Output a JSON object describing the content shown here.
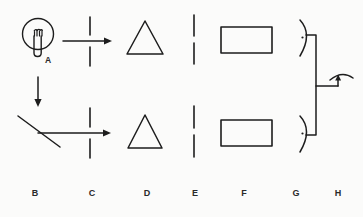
{
  "figure": {
    "kind": "hand-drawn-optics-diagram",
    "background_color": "#fbfbfa",
    "ink_color": "#1d1d1d",
    "width": 363,
    "height": 217
  },
  "inline_labels": [
    {
      "id": "label-a",
      "text": "A",
      "x": 41,
      "y": 55
    }
  ],
  "column_labels": [
    {
      "id": "label-b",
      "text": "B",
      "x": 27,
      "y": 188
    },
    {
      "id": "label-c",
      "text": "C",
      "x": 84,
      "y": 188
    },
    {
      "id": "label-d",
      "text": "D",
      "x": 139,
      "y": 188
    },
    {
      "id": "label-e",
      "text": "E",
      "x": 187,
      "y": 188
    },
    {
      "id": "label-f",
      "text": "F",
      "x": 236,
      "y": 188
    },
    {
      "id": "label-g",
      "text": "G",
      "x": 288,
      "y": 188
    },
    {
      "id": "label-h",
      "text": "H",
      "x": 330,
      "y": 188
    }
  ],
  "components": [
    {
      "id": "light-bulb-a",
      "name": "light-bulb",
      "label": "A",
      "row": "top",
      "column": "A"
    },
    {
      "id": "mirror-b",
      "name": "mirror-with-beams",
      "label": "B",
      "row": "bottom",
      "column": "B"
    },
    {
      "id": "slit-c-top",
      "name": "slit-aperture",
      "label": "C",
      "row": "top",
      "column": "C"
    },
    {
      "id": "slit-c-bottom",
      "name": "slit-aperture",
      "label": "C",
      "row": "bottom",
      "column": "C"
    },
    {
      "id": "prism-d-top",
      "name": "prism-triangle",
      "label": "D",
      "row": "top",
      "column": "D"
    },
    {
      "id": "prism-d-bottom",
      "name": "prism-triangle",
      "label": "D",
      "row": "bottom",
      "column": "D"
    },
    {
      "id": "slit-e-top",
      "name": "slit-aperture",
      "label": "E",
      "row": "top",
      "column": "E"
    },
    {
      "id": "slit-e-bottom",
      "name": "slit-aperture",
      "label": "E",
      "row": "bottom",
      "column": "E"
    },
    {
      "id": "screen-f-top",
      "name": "rectangle-screen",
      "label": "F",
      "row": "top",
      "column": "F"
    },
    {
      "id": "screen-f-bottom",
      "name": "rectangle-screen",
      "label": "F",
      "row": "bottom",
      "column": "F"
    },
    {
      "id": "eye-g-top",
      "name": "eye-observer",
      "label": "G",
      "row": "top",
      "column": "G"
    },
    {
      "id": "eye-g-bottom",
      "name": "eye-observer",
      "label": "G",
      "row": "bottom",
      "column": "G"
    },
    {
      "id": "rotation-arrow-h",
      "name": "rotation-arrow",
      "label": "H",
      "row": "middle",
      "column": "H"
    }
  ],
  "beams": [
    {
      "id": "beam-top",
      "name": "horizontal-light-beam",
      "direction": "right",
      "row": "top"
    },
    {
      "id": "beam-incident",
      "name": "vertical-incident-beam",
      "direction": "down",
      "row": "bottom"
    },
    {
      "id": "beam-reflected",
      "name": "horizontal-reflected-beam",
      "direction": "right",
      "row": "bottom"
    }
  ]
}
